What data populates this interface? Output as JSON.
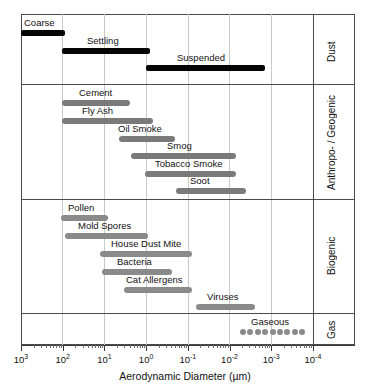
{
  "chart_data": {
    "type": "bar",
    "title": "",
    "xlabel": "Aerodynamic Diameter (µm)",
    "ylabel": "",
    "orientation": "horizontal",
    "x_scale": "log",
    "x_direction": "decreasing",
    "xlim": [
      1000,
      0.0001
    ],
    "grid": "vertical-only",
    "legend": "none",
    "x_ticks": [
      {
        "label_base": "10",
        "exp": "3",
        "value": 1000
      },
      {
        "label_base": "10",
        "exp": "2",
        "value": 100
      },
      {
        "label_base": "10",
        "exp": "1",
        "value": 10
      },
      {
        "label_base": "10",
        "exp": "0",
        "value": 1
      },
      {
        "label_base": "10",
        "exp": "-1",
        "value": 0.1
      },
      {
        "label_base": "10",
        "exp": "-2",
        "value": 0.01
      },
      {
        "label_base": "10",
        "exp": "-3",
        "value": 0.001
      },
      {
        "label_base": "10",
        "exp": "-4",
        "value": 0.0001
      }
    ],
    "groups": [
      {
        "name": "Dust",
        "color": "#050505",
        "style": "solid",
        "bars": [
          {
            "label": "Coarse",
            "x_start": 1000,
            "x_end": 100,
            "label_pos": "above-left"
          },
          {
            "label": "Settling",
            "x_start": 100,
            "x_end": 1.0,
            "label_pos": "above-center"
          },
          {
            "label": "Suspended",
            "x_start": 1.0,
            "x_end": 0.005,
            "label_pos": "above-center"
          }
        ]
      },
      {
        "name": "Anthropo- / Geogenic",
        "color": "#7a7a7a",
        "style": "solid",
        "bars": [
          {
            "label": "Cement",
            "x_start": 100,
            "x_end": 1.5,
            "label_pos": "above-center"
          },
          {
            "label": "Fly Ash",
            "x_start": 100,
            "x_end": 0.8,
            "label_pos": "above-center"
          },
          {
            "label": "Oil Smoke",
            "x_start": 20,
            "x_end": 0.3,
            "label_pos": "above-center"
          },
          {
            "label": "Smog",
            "x_start": 8,
            "x_end": 0.002,
            "label_pos": "above-center"
          },
          {
            "label": "Tobacco Smoke",
            "x_start": 1.0,
            "x_end": 0.002,
            "label_pos": "above-center"
          },
          {
            "label": "Soot",
            "x_start": 0.2,
            "x_end": 0.0008,
            "label_pos": "above-center"
          }
        ]
      },
      {
        "name": "Biogenic",
        "color": "#8a8a8a",
        "style": "solid",
        "bars": [
          {
            "label": "Pollen",
            "x_start": 100,
            "x_end": 9,
            "label_pos": "above-center"
          },
          {
            "label": "Mold Spores",
            "x_start": 80,
            "x_end": 1.2,
            "label_pos": "above-center"
          },
          {
            "label": "House Dust Mite",
            "x_start": 12,
            "x_end": 0.07,
            "label_pos": "above-center"
          },
          {
            "label": "Bacteria",
            "x_start": 11,
            "x_end": 0.2,
            "label_pos": "above-center"
          },
          {
            "label": "Cat Allergens",
            "x_start": 3,
            "x_end": 0.07,
            "label_pos": "above-center"
          },
          {
            "label": "Viruses",
            "x_start": 0.05,
            "x_end": 0.002,
            "label_pos": "above-center"
          }
        ]
      },
      {
        "name": "Gas",
        "color": "#8a8a8a",
        "style": "dotted",
        "bars": [
          {
            "label": "Gaseous",
            "x_start": 0.006,
            "x_end": 0.00015,
            "dots": 9,
            "label_pos": "above-center"
          }
        ]
      }
    ]
  },
  "axis": {
    "title": "Aerodynamic Diameter (µm)"
  },
  "colors": {
    "dust_bar": "#050505",
    "anthro_bar": "#7a7a7a",
    "biogenic_bar": "#8a8a8a",
    "gas_dot": "#8a8a8a",
    "frame": "#4a4a4a",
    "gridline": "#c9c9c9",
    "background": "#ffffff"
  }
}
